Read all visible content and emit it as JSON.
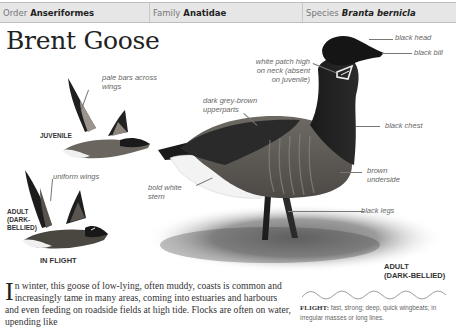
{
  "header": {
    "order_label": "Order",
    "order_value": "Anseriformes",
    "family_label": "Family",
    "family_value": "Anatidae",
    "species_label": "Species",
    "species_value": "Branta bernicla"
  },
  "title": "Brent Goose",
  "illustrations": {
    "juvenile_caption": "JUVENILE",
    "adult_flight_caption_lines": [
      "ADULT",
      "(DARK-",
      "BELLIED)"
    ],
    "in_flight_caption": "IN FLIGHT",
    "adult_standing_caption_lines": [
      "ADULT",
      "(DARK-BELLIED)"
    ]
  },
  "annotations": {
    "pale_bars": [
      "pale bars across",
      "wings"
    ],
    "uniform_wings": "uniform wings",
    "white_patch": [
      "white patch high",
      "on neck (absent",
      "on juvenile)"
    ],
    "black_head": "black head",
    "black_bill": "black bill",
    "dark_upperparts": [
      "dark grey-brown",
      "upperparts"
    ],
    "black_chest": "black chest",
    "brown_underside": [
      "brown",
      "underside"
    ],
    "bold_white_stern": [
      "bold white",
      "stern"
    ],
    "black_legs": "black legs"
  },
  "description": {
    "dropcap": "I",
    "text": "n winter, this goose of low-lying, often muddy, coasts is common and increasingly tame in many areas, coming into estuaries and harbours and even feeding on roadside fields at high tide. Flocks are often on water, upending like"
  },
  "flight": {
    "label": "FLIGHT:",
    "text": "fast, strong; deep, quick wingbeats; in irregular masses or long lines."
  },
  "colors": {
    "header_bg": "#e6e6e6",
    "goose_black": "#1c1c1c",
    "goose_brown": "#5e5a55"
  }
}
